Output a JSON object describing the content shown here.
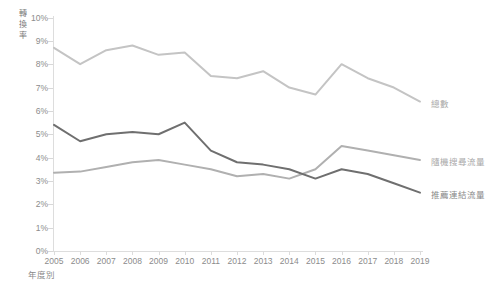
{
  "chart_data": {
    "type": "line",
    "title": "",
    "xlabel": "年度別",
    "ylabel": "轉換率",
    "categories": [
      "2005",
      "2006",
      "2007",
      "2008",
      "2009",
      "2010",
      "2011",
      "2012",
      "2013",
      "2014",
      "2015",
      "2016",
      "2017",
      "2018",
      "2019"
    ],
    "ylim": [
      0,
      10
    ],
    "ytick_labels": [
      "0%",
      "1%",
      "2%",
      "3%",
      "4%",
      "5%",
      "6%",
      "7%",
      "8%",
      "9%",
      "10%"
    ],
    "ytick_values": [
      0,
      1,
      2,
      3,
      4,
      5,
      6,
      7,
      8,
      9,
      10
    ],
    "grid": false,
    "legend_position": "right",
    "series": [
      {
        "name": "總數",
        "color": "#c4c4c4",
        "values": [
          8.7,
          8.0,
          8.6,
          8.8,
          8.4,
          8.5,
          7.5,
          7.4,
          7.7,
          7.0,
          6.7,
          8.0,
          7.4,
          7.0,
          6.4
        ]
      },
      {
        "name": "隨機搜尋流量",
        "color": "#b0b0b0",
        "values": [
          3.35,
          3.4,
          3.6,
          3.8,
          3.9,
          3.7,
          3.5,
          3.2,
          3.3,
          3.1,
          3.5,
          4.5,
          4.3,
          4.1,
          3.9
        ]
      },
      {
        "name": "推薦連結流量",
        "color": "#6f6f6f",
        "values": [
          5.4,
          4.7,
          5.0,
          5.1,
          5.0,
          5.5,
          4.3,
          3.8,
          3.7,
          3.5,
          3.1,
          3.5,
          3.3,
          2.9,
          2.5
        ]
      }
    ]
  },
  "axis": {
    "y_label_chars": [
      "轉",
      "換",
      "率"
    ],
    "x_label": "年度別"
  },
  "legend": {
    "items": [
      {
        "label": "總數",
        "color": "#c4c4c4"
      },
      {
        "label": "隨機搜尋流量",
        "color": "#b0b0b0"
      },
      {
        "label": "推薦連結流量",
        "color": "#6f6f6f"
      }
    ]
  }
}
